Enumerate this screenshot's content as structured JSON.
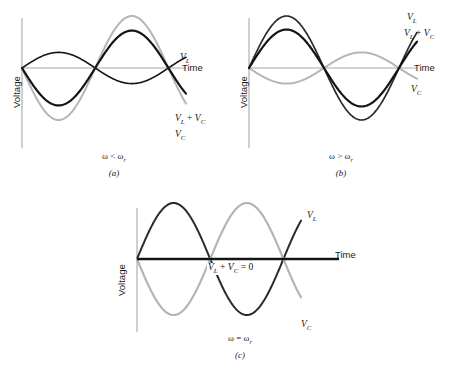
{
  "figure": {
    "axis_labels": {
      "voltage": "Voltage",
      "time": "Time"
    },
    "colors": {
      "curve_dark": "#141414",
      "curve_mid": "#3a3a3a",
      "curve_light": "#b5b5b5",
      "axis": "#a8a8a8",
      "text": "#1a1a1a"
    }
  },
  "panels": [
    {
      "id": "a",
      "caption": "(a)",
      "condition": "ω < ω",
      "condition_sub": "r",
      "labels": {
        "vl": "V",
        "vl_sub": "L",
        "vc": "V",
        "vc_sub": "C",
        "sum_lead": "V",
        "sum_lead_sub": "L",
        "sum_op": " + ",
        "sum_trail": "V",
        "sum_trail_sub": "C",
        "time": "Time",
        "voltage": "Voltage"
      }
    },
    {
      "id": "b",
      "caption": "(b)",
      "condition": "ω > ω",
      "condition_sub": "r",
      "labels": {
        "vl": "V",
        "vl_sub": "L",
        "vc": "V",
        "vc_sub": "C",
        "sum_lead": "V",
        "sum_lead_sub": "L",
        "sum_op": " + ",
        "sum_trail": "V",
        "sum_trail_sub": "C",
        "time": "Time",
        "voltage": "Voltage"
      }
    },
    {
      "id": "c",
      "caption": "(c)",
      "condition": "ω = ω",
      "condition_sub": "r",
      "labels": {
        "vl": "V",
        "vl_sub": "L",
        "vc": "V",
        "vc_sub": "C",
        "sum_lead": "V",
        "sum_lead_sub": "L",
        "sum_op": " + ",
        "sum_trail": "V",
        "sum_trail_sub": "C",
        "sum_eq": " = 0",
        "time": "Time",
        "voltage": "Voltage"
      }
    }
  ],
  "chart_data": [
    {
      "type": "line",
      "title": "(a)",
      "annotation": "ω < ω_r",
      "xlabel": "Time",
      "ylabel": "Voltage",
      "xlim": [
        0,
        1.45
      ],
      "ylim": [
        -1.15,
        1.15
      ],
      "grid": false,
      "legend": "inline-right",
      "series": [
        {
          "name": "V_L",
          "amplitude": 0.3,
          "phase_deg": 0,
          "cycles": 1.12,
          "color": "#141414",
          "width": 1.6
        },
        {
          "name": "V_C",
          "amplitude": 1.0,
          "phase_deg": 180,
          "cycles": 1.12,
          "color": "#b5b5b5",
          "width": 2.0
        },
        {
          "name": "V_L + V_C",
          "amplitude": 0.72,
          "phase_deg": 180,
          "cycles": 1.12,
          "color": "#141414",
          "width": 2.2
        }
      ]
    },
    {
      "type": "line",
      "title": "(b)",
      "annotation": "ω > ω_r",
      "xlabel": "Time",
      "ylabel": "Voltage",
      "xlim": [
        0,
        1.45
      ],
      "ylim": [
        -1.15,
        1.15
      ],
      "grid": false,
      "legend": "inline-right",
      "series": [
        {
          "name": "V_L",
          "amplitude": 1.0,
          "phase_deg": 0,
          "cycles": 1.12,
          "color": "#2b2b2b",
          "width": 1.7
        },
        {
          "name": "V_C",
          "amplitude": 0.3,
          "phase_deg": 180,
          "cycles": 1.12,
          "color": "#b5b5b5",
          "width": 2.0
        },
        {
          "name": "V_L + V_C",
          "amplitude": 0.74,
          "phase_deg": 0,
          "cycles": 1.12,
          "color": "#141414",
          "width": 2.2
        }
      ]
    },
    {
      "type": "line",
      "title": "(c)",
      "annotation": "ω = ω_r",
      "xlabel": "Time",
      "ylabel": "Voltage",
      "xlim": [
        0,
        1.45
      ],
      "ylim": [
        -1.15,
        1.15
      ],
      "grid": false,
      "legend": "inline-right",
      "series": [
        {
          "name": "V_L",
          "amplitude": 1.0,
          "phase_deg": 0,
          "cycles": 1.12,
          "color": "#2b2b2b",
          "width": 2.0
        },
        {
          "name": "V_C",
          "amplitude": 1.0,
          "phase_deg": 180,
          "cycles": 1.12,
          "color": "#b5b5b5",
          "width": 2.2
        },
        {
          "name": "V_L + V_C",
          "amplitude": 0.0,
          "phase_deg": 0,
          "cycles": 1.12,
          "color": "#141414",
          "width": 2.6
        }
      ]
    }
  ]
}
